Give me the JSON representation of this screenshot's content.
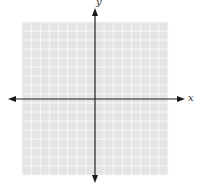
{
  "diagram": {
    "type": "coordinate-plane",
    "grid": {
      "left": 22,
      "top": 22,
      "width": 146,
      "height": 153,
      "cols": 16,
      "rows": 17,
      "fill_color": "#e4e4e4",
      "line_color": "#f7f7f7"
    },
    "origin": {
      "x": 95,
      "y": 99
    },
    "axes": {
      "color": "#1a1a1a",
      "x_axis": {
        "label": "x",
        "from_x": 8,
        "to_x": 185
      },
      "y_axis": {
        "label": "y",
        "from_y": 8,
        "to_y": 183
      }
    }
  }
}
